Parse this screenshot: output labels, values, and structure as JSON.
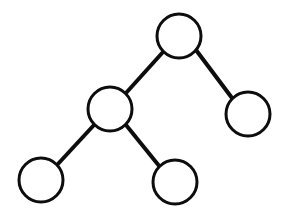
{
  "figure": {
    "title": "",
    "type": "binary-tree-diagram",
    "width": 282,
    "height": 222,
    "background_color": "#ffffff"
  },
  "style": {
    "node_stroke_color": "#0d0d0d",
    "node_fill_color": "#ffffff",
    "node_stroke_width": 3,
    "node_radius": 22,
    "edge_color": "#0d0d0d",
    "edge_width": 4
  },
  "chart_data": {
    "type": "diagram",
    "title": "",
    "nodes": [
      {
        "id": "root",
        "label": "",
        "cx": 179,
        "cy": 36,
        "r": 22,
        "level": 0,
        "role": "root"
      },
      {
        "id": "left",
        "label": "",
        "cx": 110,
        "cy": 109,
        "r": 22,
        "level": 1,
        "role": "internal"
      },
      {
        "id": "right",
        "label": "",
        "cx": 248,
        "cy": 114,
        "r": 22,
        "level": 1,
        "role": "leaf"
      },
      {
        "id": "left-left",
        "label": "",
        "cx": 41,
        "cy": 180,
        "r": 22,
        "level": 2,
        "role": "leaf"
      },
      {
        "id": "left-right",
        "label": "",
        "cx": 175,
        "cy": 182,
        "r": 22,
        "level": 2,
        "role": "leaf"
      }
    ],
    "edges": [
      {
        "id": "edge-root-left",
        "from": "root",
        "to": "left",
        "x1": 163,
        "y1": 52,
        "x2": 126,
        "y2": 93
      },
      {
        "id": "edge-root-right",
        "from": "root",
        "to": "right",
        "x1": 196,
        "y1": 50,
        "x2": 232,
        "y2": 98
      },
      {
        "id": "edge-left-leftleft",
        "from": "left",
        "to": "left-left",
        "x1": 94,
        "y1": 125,
        "x2": 57,
        "y2": 165
      },
      {
        "id": "edge-left-leftright",
        "from": "left",
        "to": "left-right",
        "x1": 126,
        "y1": 125,
        "x2": 160,
        "y2": 167
      }
    ],
    "node_count": 5,
    "edge_count": 4,
    "depth": 3
  }
}
